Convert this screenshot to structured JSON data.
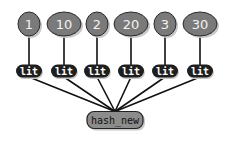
{
  "diagram": {
    "type": "tree",
    "root": {
      "label": "hash_new",
      "x": 115,
      "y": 120,
      "w": 56,
      "h": 17
    },
    "children": [
      {
        "lit_label": "lit",
        "value": "1",
        "x": 29,
        "lit_y": 71,
        "val_y": 24,
        "val_rx": 11,
        "val_ry": 12
      },
      {
        "lit_label": "lit",
        "value": "10",
        "x": 64,
        "lit_y": 71,
        "val_y": 24,
        "val_rx": 17,
        "val_ry": 12
      },
      {
        "lit_label": "lit",
        "value": "2",
        "x": 97,
        "lit_y": 71,
        "val_y": 24,
        "val_rx": 11,
        "val_ry": 12
      },
      {
        "lit_label": "lit",
        "value": "20",
        "x": 131,
        "lit_y": 71,
        "val_y": 24,
        "val_rx": 17,
        "val_ry": 12
      },
      {
        "lit_label": "lit",
        "value": "3",
        "x": 165,
        "lit_y": 71,
        "val_y": 24,
        "val_rx": 11,
        "val_ry": 12
      },
      {
        "lit_label": "lit",
        "value": "30",
        "x": 200,
        "lit_y": 71,
        "val_y": 24,
        "val_rx": 17,
        "val_ry": 12
      }
    ],
    "colors": {
      "value_fill": "#7a7a7a",
      "value_stroke": "#2a2a2a",
      "lit_fill": "#1e1e1e",
      "root_fill": "#8c8c8c",
      "root_stroke": "#222222",
      "edge": "#111111",
      "shadow": "#c8c8c8"
    }
  }
}
